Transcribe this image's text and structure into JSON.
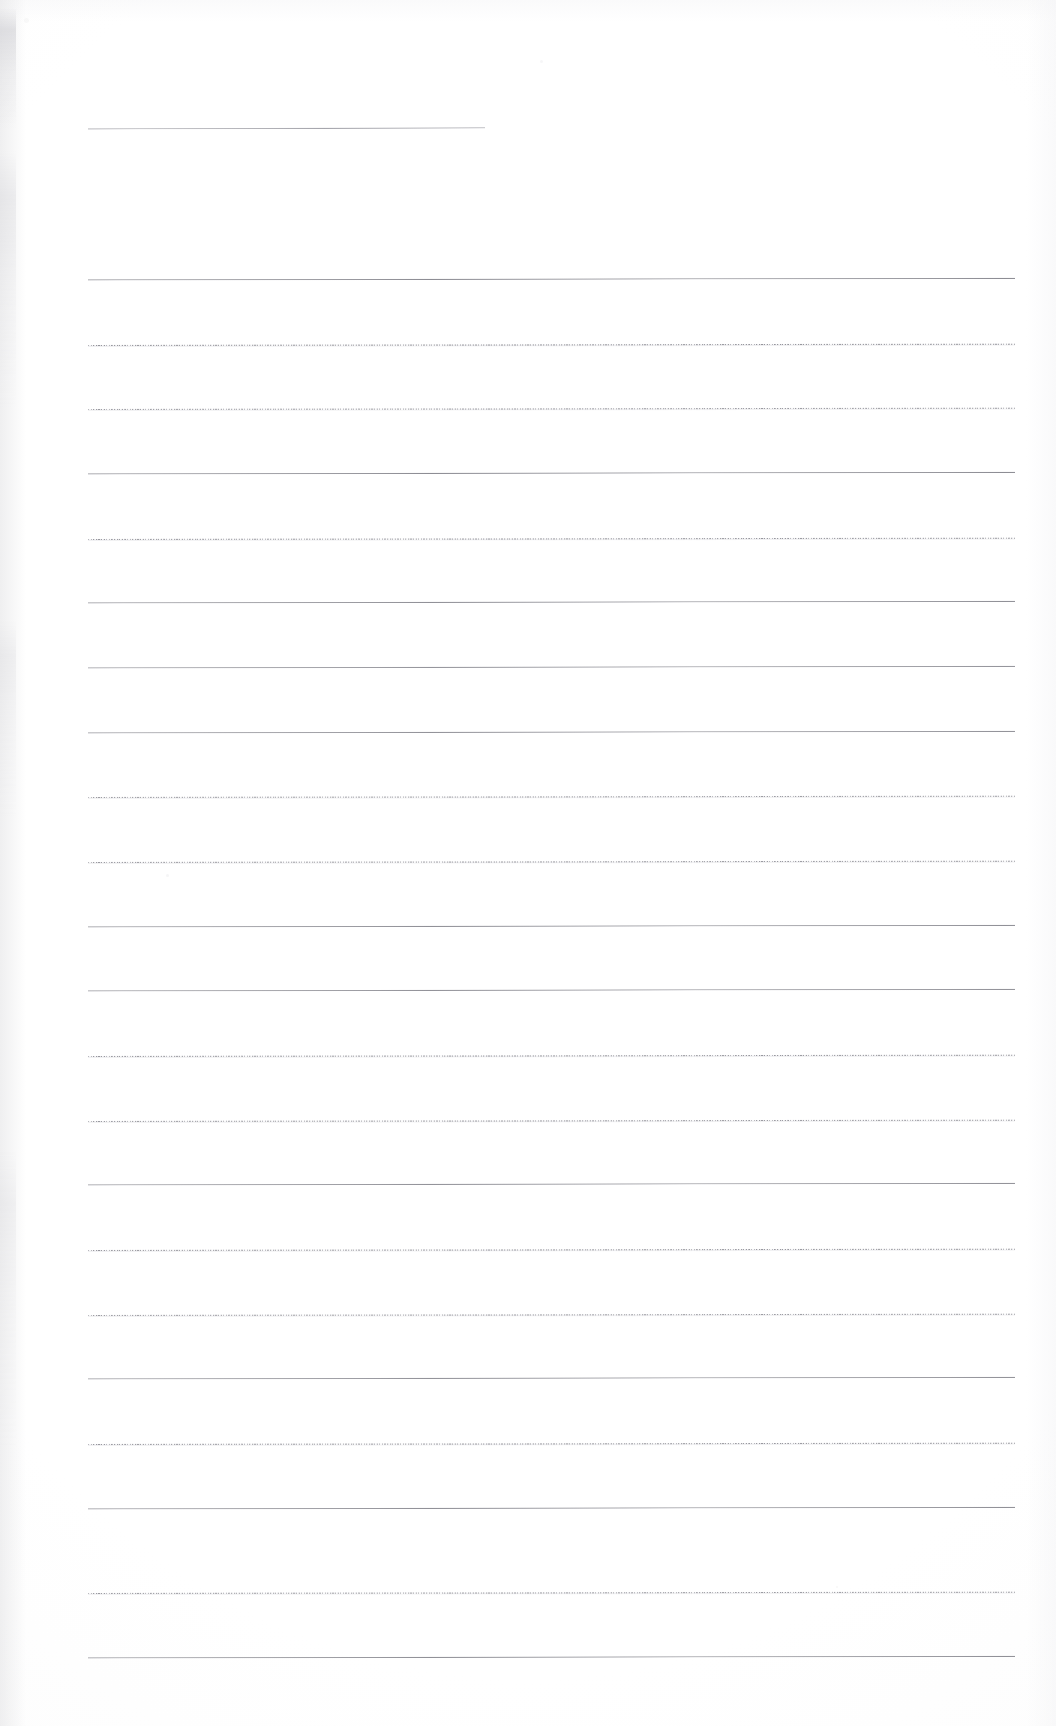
{
  "document": {
    "kind": "scanned-ruled-page",
    "title": "Blank ruled page",
    "page_width": 1056,
    "page_height": 1726,
    "background_color": "#fdfdfd",
    "rule_color": "#80808a",
    "rule_color_light": "#c6c6cc",
    "content_text": "",
    "has_handwriting": false,
    "has_printed_text": false
  },
  "layout": {
    "rule_left_x": 88,
    "rule_right_x": 1015,
    "first_full_rule_y": 279,
    "rule_spacing": 64.7,
    "rule_count": 22
  },
  "header_rule": {
    "label": "top-short-rule",
    "y": 128,
    "x_start": 88,
    "x_end": 485,
    "style": "solid",
    "tilt_deg": 0.16
  },
  "rules": [
    {
      "index": 1,
      "y": 279,
      "style": "solid",
      "tilt_deg": 0.1,
      "opacity": 0.95
    },
    {
      "index": 2,
      "y": 344,
      "style": "dotted",
      "tilt_deg": 0.08,
      "opacity": 0.85
    },
    {
      "index": 3,
      "y": 408,
      "style": "dotted",
      "tilt_deg": 0.08,
      "opacity": 0.8
    },
    {
      "index": 4,
      "y": 473,
      "style": "solid",
      "tilt_deg": 0.1,
      "opacity": 0.95
    },
    {
      "index": 5,
      "y": 538,
      "style": "dotted",
      "tilt_deg": 0.08,
      "opacity": 0.82
    },
    {
      "index": 6,
      "y": 602,
      "style": "solid",
      "tilt_deg": 0.1,
      "opacity": 0.92
    },
    {
      "index": 7,
      "y": 667,
      "style": "solid",
      "tilt_deg": 0.1,
      "opacity": 0.88
    },
    {
      "index": 8,
      "y": 732,
      "style": "solid",
      "tilt_deg": 0.1,
      "opacity": 0.9
    },
    {
      "index": 9,
      "y": 796,
      "style": "dotted",
      "tilt_deg": 0.08,
      "opacity": 0.78
    },
    {
      "index": 10,
      "y": 861,
      "style": "dotted",
      "tilt_deg": 0.08,
      "opacity": 0.8
    },
    {
      "index": 11,
      "y": 926,
      "style": "solid",
      "tilt_deg": 0.1,
      "opacity": 0.92
    },
    {
      "index": 12,
      "y": 990,
      "style": "solid",
      "tilt_deg": 0.1,
      "opacity": 0.9
    },
    {
      "index": 13,
      "y": 1055,
      "style": "dotted",
      "tilt_deg": 0.08,
      "opacity": 0.82
    },
    {
      "index": 14,
      "y": 1120,
      "style": "dotted",
      "tilt_deg": 0.08,
      "opacity": 0.8
    },
    {
      "index": 15,
      "y": 1184,
      "style": "solid",
      "tilt_deg": 0.1,
      "opacity": 0.9
    },
    {
      "index": 16,
      "y": 1249,
      "style": "dotted",
      "tilt_deg": 0.08,
      "opacity": 0.82
    },
    {
      "index": 17,
      "y": 1314,
      "style": "dotted",
      "tilt_deg": 0.08,
      "opacity": 0.78
    },
    {
      "index": 18,
      "y": 1378,
      "style": "solid",
      "tilt_deg": 0.1,
      "opacity": 0.9
    },
    {
      "index": 19,
      "y": 1443,
      "style": "dotted",
      "tilt_deg": 0.08,
      "opacity": 0.82
    },
    {
      "index": 20,
      "y": 1508,
      "style": "solid",
      "tilt_deg": 0.1,
      "opacity": 0.92
    },
    {
      "index": 21,
      "y": 1592,
      "style": "dotted",
      "tilt_deg": 0.08,
      "opacity": 0.8
    },
    {
      "index": 22,
      "y": 1657,
      "style": "solid",
      "tilt_deg": 0.1,
      "opacity": 0.92
    }
  ],
  "specks": [
    {
      "x": 166,
      "y": 874,
      "size": 3,
      "opacity": 0.35
    },
    {
      "x": 540,
      "y": 60,
      "size": 3,
      "opacity": 0.3
    },
    {
      "x": 836,
      "y": 1586,
      "size": 2,
      "opacity": 0.25
    },
    {
      "x": 24,
      "y": 18,
      "size": 5,
      "opacity": 0.22
    }
  ]
}
